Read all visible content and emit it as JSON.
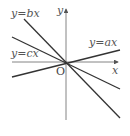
{
  "diagram": {
    "axes": {
      "x_label": "x",
      "y_label": "y",
      "origin_label": "O"
    },
    "lines": [
      {
        "label": "y=ax",
        "slope_sign": "positive",
        "x1": 12,
        "y1": 77,
        "x2": 120,
        "y2": 50
      },
      {
        "label": "y=bx",
        "slope_sign": "negative",
        "x1": 24,
        "y1": 19,
        "x2": 120,
        "y2": 118
      },
      {
        "label": "y=cx",
        "slope_sign": "negative",
        "x1": 12,
        "y1": 37,
        "x2": 120,
        "y2": 89
      }
    ],
    "colors": {
      "line": "#333333",
      "axis": "#555555",
      "text": "#555555"
    }
  }
}
